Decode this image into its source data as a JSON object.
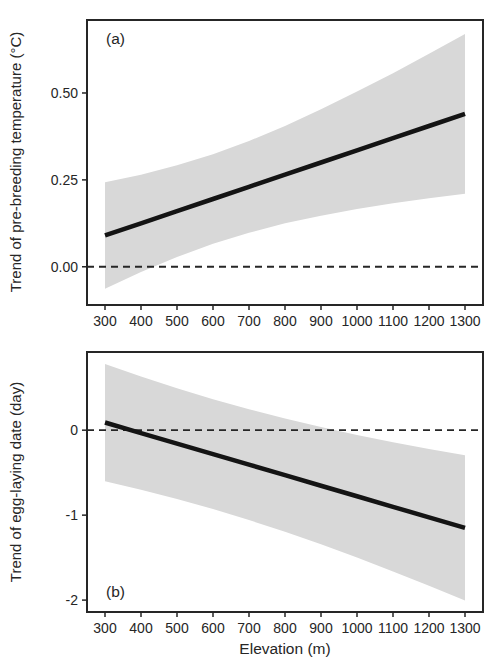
{
  "styles": {
    "background": "#ffffff",
    "frame_color": "#262626",
    "text_color": "#262626",
    "zero_line_color": "#262626"
  },
  "chart_data": [
    {
      "panel": "a",
      "type": "line",
      "title": "(a)",
      "ylabel": "Trend of pre-breeding temperature (°C)",
      "xlabel": "",
      "x": [
        300,
        400,
        500,
        600,
        700,
        800,
        900,
        1000,
        1100,
        1200,
        1300
      ],
      "line": [
        0.09,
        0.125,
        0.16,
        0.195,
        0.23,
        0.265,
        0.3,
        0.335,
        0.37,
        0.405,
        0.44
      ],
      "ci_upper": [
        0.243,
        0.265,
        0.292,
        0.324,
        0.362,
        0.405,
        0.453,
        0.504,
        0.557,
        0.613,
        0.67
      ],
      "ci_lower": [
        -0.063,
        -0.015,
        0.028,
        0.066,
        0.098,
        0.125,
        0.147,
        0.166,
        0.183,
        0.197,
        0.21
      ],
      "zero_line": 0,
      "xlim": [
        250,
        1350
      ],
      "ylim": [
        -0.11,
        0.71
      ],
      "xticks": [
        300,
        400,
        500,
        600,
        700,
        800,
        900,
        1000,
        1100,
        1200,
        1300
      ],
      "xtick_labels": [
        "300",
        "400",
        "500",
        "600",
        "700",
        "800",
        "900",
        "1000",
        "1100",
        "1200",
        "1300"
      ],
      "yticks": [
        0,
        0.25,
        0.5
      ],
      "ytick_labels": [
        "0.00",
        "0.25",
        "0.50"
      ],
      "band_color": "#d8d8d8",
      "line_color": "#141414",
      "grid": false,
      "legend": false
    },
    {
      "panel": "b",
      "type": "line",
      "title": "(b)",
      "ylabel": "Trend of egg-laying date (day)",
      "xlabel": "Elevation (m)",
      "x": [
        300,
        400,
        500,
        600,
        700,
        800,
        900,
        1000,
        1100,
        1200,
        1300
      ],
      "line": [
        0.09,
        -0.034,
        -0.158,
        -0.282,
        -0.406,
        -0.53,
        -0.654,
        -0.778,
        -0.902,
        -1.026,
        -1.15
      ],
      "ci_upper": [
        0.78,
        0.632,
        0.494,
        0.365,
        0.246,
        0.136,
        0.036,
        -0.056,
        -0.142,
        -0.221,
        -0.295
      ],
      "ci_lower": [
        -0.6,
        -0.7,
        -0.81,
        -0.929,
        -1.058,
        -1.196,
        -1.344,
        -1.5,
        -1.662,
        -1.831,
        -2.005
      ],
      "zero_line": 0,
      "xlim": [
        250,
        1350
      ],
      "ylim": [
        -2.14,
        0.92
      ],
      "xticks": [
        300,
        400,
        500,
        600,
        700,
        800,
        900,
        1000,
        1100,
        1200,
        1300
      ],
      "xtick_labels": [
        "300",
        "400",
        "500",
        "600",
        "700",
        "800",
        "900",
        "1000",
        "1100",
        "1200",
        "1300"
      ],
      "yticks": [
        0,
        -1,
        -2
      ],
      "ytick_labels": [
        "0",
        "-1",
        "-2"
      ],
      "band_color": "#d8d8d8",
      "line_color": "#141414",
      "grid": false,
      "legend": false
    }
  ]
}
